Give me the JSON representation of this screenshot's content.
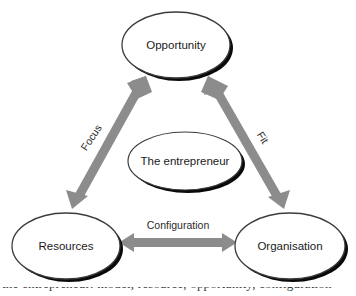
{
  "diagram": {
    "nodes": [
      {
        "id": "opportunity",
        "label": "Opportunity",
        "cx": 176,
        "cy": 45,
        "rx": 54,
        "ry": 33
      },
      {
        "id": "the-entrepreneur",
        "label": "The entrepreneur",
        "cx": 185,
        "cy": 161,
        "rx": 57,
        "ry": 29
      },
      {
        "id": "resources",
        "label": "Resources",
        "cx": 66,
        "cy": 246,
        "rx": 54,
        "ry": 33
      },
      {
        "id": "organisation",
        "label": "Organisation",
        "cx": 290,
        "cy": 246,
        "rx": 55,
        "ry": 33
      }
    ],
    "edges": [
      {
        "id": "focus",
        "label": "Focus",
        "from": "resources",
        "to": "opportunity",
        "direction": "both",
        "label_rotation": -56
      },
      {
        "id": "fit",
        "label": "Fit",
        "from": "organisation",
        "to": "opportunity",
        "direction": "both",
        "label_rotation": 58
      },
      {
        "id": "configuration",
        "label": "Configuration",
        "from": "resources",
        "to": "organisation",
        "direction": "both",
        "label_rotation": 0
      }
    ],
    "colors": {
      "arrow": "#8c8c8c",
      "arrow_dark": "#7a7a7a",
      "node_outline": "#3c3c3c",
      "node_fill": "#ffffff",
      "node_shadow": "#0a0a0a",
      "label_text": "#1a1a1a",
      "edge_text": "#2b2b2b",
      "background": "#ffffff"
    }
  },
  "caption": {
    "text": "the entrepreneur: model, resource, opportunity, configuration"
  }
}
